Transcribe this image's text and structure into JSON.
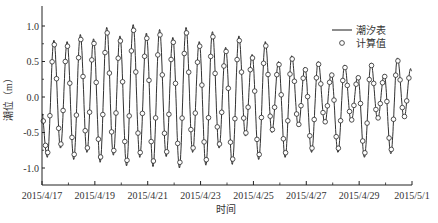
{
  "chart_data": {
    "type": "line",
    "title": "",
    "xlabel": "时间",
    "ylabel": "潮位（m）",
    "ylim": [
      -1.25,
      1.25
    ],
    "yticks": [
      1.0,
      0.5,
      0.0,
      -0.5,
      -1.0
    ],
    "ytick_labels": [
      "1.0",
      "0.5",
      "0.0",
      "-0.5",
      "-1.0"
    ],
    "xlim_days": [
      0,
      14
    ],
    "xticks_days": [
      0,
      2,
      4,
      6,
      8,
      10,
      12,
      14
    ],
    "xtick_labels": [
      "2015/4/17",
      "2015/4/19",
      "2015/4/21",
      "2015/4/23",
      "2015/4/25",
      "2015/4/27",
      "2015/4/29",
      "2015/5/1"
    ],
    "grid": false,
    "legend": {
      "position": "upper right",
      "entries": [
        {
          "label": "潮汐表",
          "marker": "line"
        },
        {
          "label": "计算值",
          "marker": "open-circle"
        }
      ]
    },
    "series": [
      {
        "name": "潮汐表",
        "style": "line",
        "description": "Semi-diurnal tide (~2 cycles/day); peaks ~0.75-0.8 m and troughs ~-0.85 m on 4/17-4/19, max range around 4/21-4/23 (peaks ~0.95, troughs ~-1.0), decreasing after 4/25 with diurnal inequality (peaks ~0.3-0.55 m, troughs ~-0.45 to -0.85 m) toward 5/1.",
        "peak_days": [
          0.45,
          0.95,
          1.45,
          1.95,
          2.45,
          2.95,
          3.45,
          3.95,
          4.45,
          4.95,
          5.45,
          5.95,
          6.45,
          6.95,
          7.45,
          7.95,
          8.45,
          8.95,
          9.45,
          9.95,
          10.45,
          10.95,
          11.45,
          11.95,
          12.45,
          12.95,
          13.45,
          13.95
        ],
        "peak_values": [
          0.8,
          0.78,
          0.88,
          0.82,
          0.98,
          0.86,
          1.02,
          0.9,
          0.95,
          0.84,
          0.98,
          0.78,
          0.92,
          0.7,
          0.86,
          0.6,
          0.78,
          0.5,
          0.58,
          0.42,
          0.5,
          0.34,
          0.45,
          0.3,
          0.48,
          0.32,
          0.55,
          0.4
        ],
        "trough_days": [
          0.2,
          0.7,
          1.2,
          1.7,
          2.2,
          2.7,
          3.2,
          3.7,
          4.2,
          4.7,
          5.2,
          5.7,
          6.2,
          6.7,
          7.2,
          7.7,
          8.2,
          8.7,
          9.2,
          9.7,
          10.2,
          10.7,
          11.2,
          11.7,
          12.2,
          12.7,
          13.2,
          13.7
        ],
        "trough_values": [
          -0.85,
          -0.72,
          -0.88,
          -0.78,
          -0.92,
          -0.82,
          -0.97,
          -0.85,
          -0.98,
          -0.84,
          -1.0,
          -0.78,
          -0.96,
          -0.72,
          -0.95,
          -0.55,
          -0.88,
          -0.5,
          -0.85,
          -0.42,
          -0.78,
          -0.38,
          -0.78,
          -0.35,
          -0.85,
          -0.32,
          -0.8,
          -0.3
        ]
      },
      {
        "name": "计算值",
        "style": "open-circle markers",
        "description": "Computed values closely tracking the tide table line, sampled roughly every 2 hours; slightly lower peak/trough magnitudes than the line."
      }
    ]
  }
}
